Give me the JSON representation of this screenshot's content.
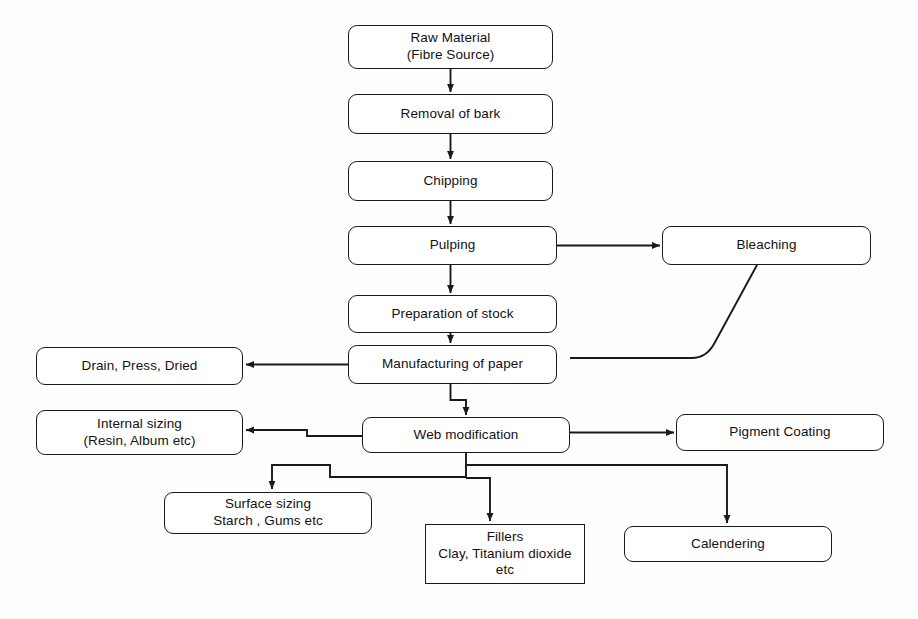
{
  "diagram": {
    "stroke_color": "#1a1a1a",
    "background_color": "#fefefe",
    "nodes": [
      {
        "id": "raw-material",
        "label": "Raw Material\n(Fibre Source)",
        "x": 348,
        "y": 25,
        "w": 205,
        "h": 44,
        "shape": "rounded"
      },
      {
        "id": "removal-of-bark",
        "label": "Removal of bark",
        "x": 348,
        "y": 94,
        "w": 205,
        "h": 40,
        "shape": "rounded"
      },
      {
        "id": "chipping",
        "label": "Chipping",
        "x": 348,
        "y": 161,
        "w": 205,
        "h": 40,
        "shape": "rounded"
      },
      {
        "id": "pulping",
        "label": "Pulping",
        "x": 348,
        "y": 226,
        "w": 209,
        "h": 39,
        "shape": "rounded"
      },
      {
        "id": "bleaching",
        "label": "Bleaching",
        "x": 662,
        "y": 226,
        "w": 209,
        "h": 39,
        "shape": "rounded"
      },
      {
        "id": "preparation-of-stock",
        "label": "Preparation of stock",
        "x": 348,
        "y": 295,
        "w": 209,
        "h": 38,
        "shape": "rounded"
      },
      {
        "id": "manufacturing-of-paper",
        "label": "Manufacturing of paper",
        "x": 348,
        "y": 345,
        "w": 209,
        "h": 39,
        "shape": "rounded"
      },
      {
        "id": "drain-press-dried",
        "label": "Drain, Press, Dried",
        "x": 36,
        "y": 347,
        "w": 207,
        "h": 38,
        "shape": "rounded"
      },
      {
        "id": "web-modification",
        "label": "Web modification",
        "x": 362,
        "y": 417,
        "w": 208,
        "h": 36,
        "shape": "rounded"
      },
      {
        "id": "internal-sizing",
        "label": "Internal sizing\n(Resin, Album etc)",
        "x": 36,
        "y": 410,
        "w": 207,
        "h": 45,
        "shape": "rounded"
      },
      {
        "id": "pigment-coating",
        "label": "Pigment Coating",
        "x": 676,
        "y": 414,
        "w": 208,
        "h": 37,
        "shape": "rounded"
      },
      {
        "id": "surface-sizing",
        "label": "Surface sizing\nStarch , Gums etc",
        "x": 164,
        "y": 492,
        "w": 208,
        "h": 42,
        "shape": "rounded"
      },
      {
        "id": "fillers",
        "label": "Fillers\nClay, Titanium dioxide\netc",
        "x": 425,
        "y": 524,
        "w": 160,
        "h": 60,
        "shape": "sharp"
      },
      {
        "id": "calendering",
        "label": "Calendering",
        "x": 624,
        "y": 526,
        "w": 208,
        "h": 36,
        "shape": "rounded"
      }
    ],
    "edges": [
      {
        "id": "raw-to-bark",
        "from": "raw-material",
        "to": "removal-of-bark",
        "arrow": true
      },
      {
        "id": "bark-to-chipping",
        "from": "removal-of-bark",
        "to": "chipping",
        "arrow": true
      },
      {
        "id": "chipping-to-pulping",
        "from": "chipping",
        "to": "pulping",
        "arrow": true
      },
      {
        "id": "pulping-to-bleaching",
        "from": "pulping",
        "to": "bleaching",
        "arrow": true
      },
      {
        "id": "pulping-to-preparation",
        "from": "pulping",
        "to": "preparation-of-stock",
        "arrow": true
      },
      {
        "id": "preparation-to-manufacturing",
        "from": "preparation-of-stock",
        "to": "manufacturing-of-paper",
        "arrow": true
      },
      {
        "id": "bleaching-to-manufacturing",
        "from": "bleaching",
        "to": "manufacturing-of-paper",
        "arrow": false
      },
      {
        "id": "manufacturing-to-drain",
        "from": "manufacturing-of-paper",
        "to": "drain-press-dried",
        "arrow": true
      },
      {
        "id": "manufacturing-to-web",
        "from": "manufacturing-of-paper",
        "to": "web-modification",
        "arrow": true
      },
      {
        "id": "web-to-internal-sizing",
        "from": "web-modification",
        "to": "internal-sizing",
        "arrow": true
      },
      {
        "id": "web-to-pigment-coating",
        "from": "web-modification",
        "to": "pigment-coating",
        "arrow": true
      },
      {
        "id": "web-to-surface-sizing",
        "from": "web-modification",
        "to": "surface-sizing",
        "arrow": true
      },
      {
        "id": "web-to-fillers",
        "from": "web-modification",
        "to": "fillers",
        "arrow": true
      },
      {
        "id": "web-to-calendering",
        "from": "web-modification",
        "to": "calendering",
        "arrow": true
      }
    ]
  }
}
